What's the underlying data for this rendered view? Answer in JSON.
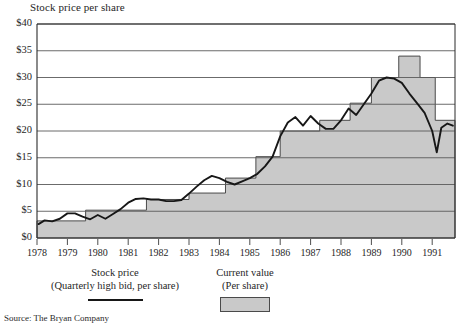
{
  "chart_data": {
    "type": "area",
    "title": "Stock price per share",
    "xlabel": "",
    "ylabel": "",
    "ylim": [
      0,
      40
    ],
    "xlim": [
      1978,
      1991.75
    ],
    "ytick_values": [
      0,
      5,
      10,
      15,
      20,
      25,
      30,
      35,
      40
    ],
    "ytick_labels": [
      "$0",
      "$5",
      "$10",
      "$15",
      "$20",
      "$25",
      "$30",
      "$35",
      "$40"
    ],
    "xtick_labels": [
      "1978",
      "1979",
      "1980",
      "1981",
      "1982",
      "1983",
      "1984",
      "1985",
      "1986",
      "1987",
      "1988",
      "1989",
      "1990",
      "1991"
    ],
    "grid": "horizontal",
    "legend_position": "below-plot",
    "series": [
      {
        "name": "Current value",
        "type": "step-area",
        "fill_color": "#c9c9c9",
        "edge_color": "#4a4a4a",
        "steps": [
          {
            "start": 1978.0,
            "end": 1979.6,
            "value": 3.2
          },
          {
            "start": 1979.6,
            "end": 1981.6,
            "value": 5.2
          },
          {
            "start": 1981.6,
            "end": 1983.0,
            "value": 7.2
          },
          {
            "start": 1983.0,
            "end": 1984.2,
            "value": 8.4
          },
          {
            "start": 1984.2,
            "end": 1985.2,
            "value": 11.2
          },
          {
            "start": 1985.2,
            "end": 1986.0,
            "value": 15.2
          },
          {
            "start": 1986.0,
            "end": 1987.3,
            "value": 20.0
          },
          {
            "start": 1987.3,
            "end": 1988.3,
            "value": 22.0
          },
          {
            "start": 1988.3,
            "end": 1989.0,
            "value": 25.2
          },
          {
            "start": 1989.0,
            "end": 1989.9,
            "value": 30.0
          },
          {
            "start": 1989.9,
            "end": 1990.6,
            "value": 34.0
          },
          {
            "start": 1990.6,
            "end": 1991.1,
            "value": 30.0
          },
          {
            "start": 1991.1,
            "end": 1991.75,
            "value": 22.0
          }
        ]
      },
      {
        "name": "Stock price",
        "type": "line",
        "line_color": "#171717",
        "points": [
          [
            1978.05,
            2.6
          ],
          [
            1978.25,
            3.3
          ],
          [
            1978.5,
            3.1
          ],
          [
            1978.75,
            3.6
          ],
          [
            1979.0,
            4.6
          ],
          [
            1979.25,
            4.6
          ],
          [
            1979.5,
            4.0
          ],
          [
            1979.75,
            3.5
          ],
          [
            1980.0,
            4.3
          ],
          [
            1980.25,
            3.6
          ],
          [
            1980.5,
            4.5
          ],
          [
            1980.75,
            5.4
          ],
          [
            1981.0,
            6.6
          ],
          [
            1981.25,
            7.3
          ],
          [
            1981.5,
            7.4
          ],
          [
            1981.75,
            7.2
          ],
          [
            1982.0,
            7.2
          ],
          [
            1982.25,
            6.9
          ],
          [
            1982.5,
            6.9
          ],
          [
            1982.75,
            7.1
          ],
          [
            1983.0,
            8.3
          ],
          [
            1983.25,
            9.6
          ],
          [
            1983.5,
            10.8
          ],
          [
            1983.75,
            11.6
          ],
          [
            1984.0,
            11.2
          ],
          [
            1984.25,
            10.5
          ],
          [
            1984.5,
            10.0
          ],
          [
            1984.75,
            10.6
          ],
          [
            1985.0,
            11.2
          ],
          [
            1985.25,
            12.0
          ],
          [
            1985.5,
            13.4
          ],
          [
            1985.75,
            15.2
          ],
          [
            1986.0,
            19.0
          ],
          [
            1986.25,
            21.6
          ],
          [
            1986.5,
            22.6
          ],
          [
            1986.75,
            21.0
          ],
          [
            1987.0,
            22.8
          ],
          [
            1987.25,
            21.4
          ],
          [
            1987.5,
            20.4
          ],
          [
            1987.75,
            20.4
          ],
          [
            1988.0,
            22.0
          ],
          [
            1988.25,
            24.2
          ],
          [
            1988.5,
            23.0
          ],
          [
            1988.75,
            25.0
          ],
          [
            1989.0,
            27.0
          ],
          [
            1989.25,
            29.4
          ],
          [
            1989.5,
            30.0
          ],
          [
            1989.75,
            29.8
          ],
          [
            1990.0,
            29.0
          ],
          [
            1990.25,
            27.0
          ],
          [
            1990.5,
            25.2
          ],
          [
            1990.75,
            23.4
          ],
          [
            1991.0,
            20.0
          ],
          [
            1991.15,
            16.0
          ],
          [
            1991.3,
            20.6
          ],
          [
            1991.5,
            21.4
          ],
          [
            1991.68,
            21.0
          ]
        ]
      }
    ],
    "legend": [
      {
        "label_line1": "Stock price",
        "label_line2": "(Quarterly high bid, per share)",
        "marker": "line"
      },
      {
        "label_line1": "Current value",
        "label_line2": "(Per share)",
        "marker": "box"
      }
    ]
  },
  "source_note": "Source: The Bryan Company"
}
